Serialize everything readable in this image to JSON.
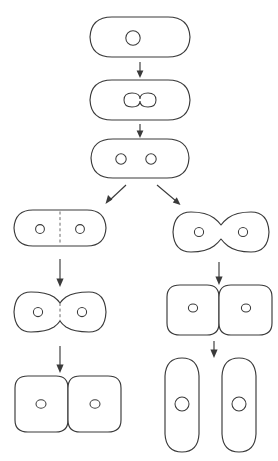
{
  "figure": {
    "subtitle": "Binary fission: nucleoid replication followed by two division modes",
    "background_color": "#ffffff",
    "stroke_color": "#3a3a3a",
    "dash_color": "#6b6b6b",
    "width": 278,
    "height": 461,
    "caption": "",
    "labels": []
  },
  "stages": [
    {
      "id": "stage-1-parent-cell",
      "name": "parent-cell-single-nucleoid",
      "label": "",
      "branch": "trunk",
      "shape": "rod-horizontal-rounded",
      "nucleoid_count": 1,
      "nucleoid_shape": "circle",
      "septum": "none",
      "constriction": "none",
      "cx": 140,
      "cy": 37,
      "width": 94,
      "height": 40
    },
    {
      "id": "stage-2-dumbbell-nucleoid",
      "name": "cell-with-dividing-nucleoid",
      "label": "",
      "branch": "trunk",
      "shape": "rod-horizontal-rounded",
      "nucleoid_count": 1,
      "nucleoid_shape": "dumbbell",
      "septum": "none",
      "constriction": "none",
      "cx": 140,
      "cy": 100,
      "width": 94,
      "height": 40
    },
    {
      "id": "stage-3-two-nucleoids",
      "name": "cell-with-two-nucleoids",
      "label": "",
      "branch": "trunk",
      "shape": "rod-horizontal-rounded",
      "nucleoid_count": 2,
      "nucleoid_shape": "circle",
      "septum": "none",
      "constriction": "none",
      "cx": 140,
      "cy": 158,
      "width": 94,
      "height": 40
    },
    {
      "id": "stage-4-left-septum",
      "name": "septum-formation-cell",
      "label": "",
      "branch": "left",
      "shape": "rod-horizontal-rounded",
      "nucleoid_count": 2,
      "nucleoid_shape": "circle",
      "septum": "dashed-center",
      "constriction": "none",
      "cx": 60,
      "cy": 228,
      "width": 90,
      "height": 38
    },
    {
      "id": "stage-5-left-pinched",
      "name": "septum-constricting-cell",
      "label": "",
      "branch": "left",
      "shape": "pinched-pair",
      "nucleoid_count": 2,
      "nucleoid_shape": "circle",
      "septum": "dashed-center",
      "constriction": "partial",
      "cx": 60,
      "cy": 312,
      "width": 92,
      "height": 42
    },
    {
      "id": "stage-6-left-daughters",
      "name": "attached-daughter-cells",
      "label": "",
      "branch": "left",
      "shape": "square-pair-attached",
      "nucleoid_count": 2,
      "nucleoid_shape": "circle",
      "septum": "solid-center",
      "constriction": "complete",
      "cx": 68,
      "cy": 404,
      "width": 112,
      "height": 62
    },
    {
      "id": "stage-7-right-pinched",
      "name": "constricting-cell",
      "label": "",
      "branch": "right",
      "shape": "pinched-pair",
      "nucleoid_count": 2,
      "nucleoid_shape": "circle",
      "septum": "none",
      "constriction": "partial",
      "cx": 221,
      "cy": 232,
      "width": 96,
      "height": 42
    },
    {
      "id": "stage-8-right-daughters",
      "name": "attached-daughter-cells",
      "label": "",
      "branch": "right",
      "shape": "square-pair-attached",
      "nucleoid_count": 2,
      "nucleoid_shape": "circle",
      "septum": "solid-center",
      "constriction": "complete",
      "cx": 221,
      "cy": 307,
      "width": 112,
      "height": 58
    },
    {
      "id": "stage-9-right-separated",
      "name": "separated-daughter-cells",
      "label": "",
      "branch": "right",
      "shape": "rod-vertical-pair-separated",
      "nucleoid_count": 2,
      "nucleoid_shape": "circle",
      "septum": "none",
      "constriction": "complete",
      "cx": 221,
      "cy": 405,
      "width": 112,
      "height": 96
    }
  ],
  "arrows": [
    {
      "id": "arrow-1",
      "name": "arrow-down-stage1-to-stage2",
      "from": "stage-1-parent-cell",
      "to": "stage-2-dumbbell-nucleoid",
      "direction": "down",
      "x1": 140,
      "y1": 62,
      "x2": 140,
      "y2": 77
    },
    {
      "id": "arrow-2",
      "name": "arrow-down-stage2-to-stage3",
      "from": "stage-2-dumbbell-nucleoid",
      "to": "stage-3-two-nucleoids",
      "direction": "down",
      "x1": 140,
      "y1": 122,
      "x2": 140,
      "y2": 136
    },
    {
      "id": "arrow-3",
      "name": "arrow-diagonal-branch-left",
      "from": "stage-3-two-nucleoids",
      "to": "stage-4-left-septum",
      "direction": "down-left",
      "x1": 124,
      "y1": 184,
      "x2": 104,
      "y2": 203
    },
    {
      "id": "arrow-4",
      "name": "arrow-diagonal-branch-right",
      "from": "stage-3-two-nucleoids",
      "to": "stage-7-right-pinched",
      "direction": "down-right",
      "x1": 158,
      "y1": 184,
      "x2": 180,
      "y2": 205
    },
    {
      "id": "arrow-5",
      "name": "arrow-down-left-branch-1",
      "from": "stage-4-left-septum",
      "to": "stage-5-left-pinched",
      "direction": "down",
      "x1": 60,
      "y1": 259,
      "x2": 60,
      "y2": 285
    },
    {
      "id": "arrow-6",
      "name": "arrow-down-left-branch-2",
      "from": "stage-5-left-pinched",
      "to": "stage-6-left-daughters",
      "direction": "down",
      "x1": 60,
      "y1": 346,
      "x2": 60,
      "y2": 370
    },
    {
      "id": "arrow-7",
      "name": "arrow-down-right-branch-1",
      "from": "stage-7-right-pinched",
      "to": "stage-8-right-daughters",
      "direction": "down",
      "x1": 218,
      "y1": 262,
      "x2": 218,
      "y2": 283
    },
    {
      "id": "arrow-8",
      "name": "arrow-down-right-branch-2",
      "from": "stage-8-right-daughters",
      "to": "stage-9-right-separated",
      "direction": "down",
      "x1": 214,
      "y1": 340,
      "x2": 214,
      "y2": 356
    }
  ]
}
